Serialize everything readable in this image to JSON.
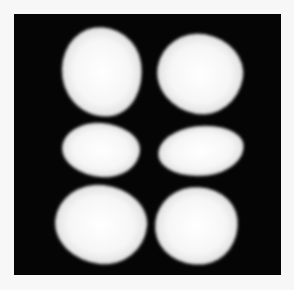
{
  "image": {
    "description": "Grayscale photograph of a laser beam transverse mode pattern showing six bright lobes arranged in 2 columns by 3 rows on a black background, framed by a light border",
    "colors": {
      "border": "#f7f7f7",
      "background": "#050505",
      "lobe": "#ffffff"
    },
    "photo_bounds": {
      "x": 14,
      "y": 14,
      "width": 267,
      "height": 261
    },
    "lobes": [
      {
        "name": "top-left",
        "x": 48,
        "y": 13,
        "w": 80,
        "h": 90,
        "rot": -8
      },
      {
        "name": "top-right",
        "x": 143,
        "y": 20,
        "w": 86,
        "h": 80,
        "rot": 10
      },
      {
        "name": "middle-left",
        "x": 48,
        "y": 109,
        "w": 78,
        "h": 54,
        "rot": 4
      },
      {
        "name": "middle-right",
        "x": 144,
        "y": 112,
        "w": 86,
        "h": 50,
        "rot": -6
      },
      {
        "name": "bottom-left",
        "x": 41,
        "y": 171,
        "w": 92,
        "h": 79,
        "rot": 6
      },
      {
        "name": "bottom-right",
        "x": 141,
        "y": 173,
        "w": 83,
        "h": 78,
        "rot": -6
      }
    ]
  }
}
